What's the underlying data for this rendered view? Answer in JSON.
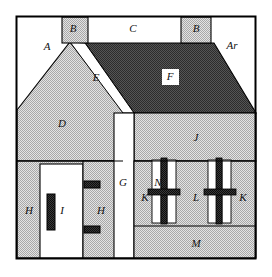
{
  "figure": {
    "kind": "architectural-elevation-diagram",
    "canvas": {
      "width": 272,
      "height": 277
    },
    "frame": {
      "x": 16,
      "y": 16,
      "width": 240,
      "height": 243
    }
  },
  "colors": {
    "background": "#ffffff",
    "outline": "#000000",
    "light_fill": "#ffffff",
    "hatch_fill": "#c9c9c9",
    "dark_fill": "#4a4a4a",
    "very_dark_fill": "#2b2b2b",
    "text": "#111111"
  },
  "labels": [
    {
      "id": "A",
      "text": "A",
      "x": 47,
      "y": 47,
      "zone": "sky-upper-left",
      "boxed": false
    },
    {
      "id": "B1",
      "text": "B",
      "x": 73,
      "y": 29,
      "zone": "chimney-left",
      "boxed": false
    },
    {
      "id": "C",
      "text": "C",
      "x": 133,
      "y": 29,
      "zone": "ridge-top",
      "boxed": false
    },
    {
      "id": "B2",
      "text": "B",
      "x": 196,
      "y": 29,
      "zone": "chimney-right",
      "boxed": false
    },
    {
      "id": "Ar",
      "text": "Ar",
      "x": 232,
      "y": 46,
      "zone": "sky-upper-right",
      "boxed": false
    },
    {
      "id": "E",
      "text": "E",
      "x": 96,
      "y": 78,
      "zone": "verge-board",
      "boxed": false
    },
    {
      "id": "F",
      "text": "F",
      "x": 170,
      "y": 77,
      "zone": "main-roof-slope",
      "boxed": true
    },
    {
      "id": "D",
      "text": "D",
      "x": 62,
      "y": 124,
      "zone": "gable-wall",
      "boxed": false
    },
    {
      "id": "J",
      "text": "J",
      "x": 196,
      "y": 138,
      "zone": "upper-wall-right",
      "boxed": false
    },
    {
      "id": "G",
      "text": "G",
      "x": 123,
      "y": 183,
      "zone": "central-pier",
      "boxed": false
    },
    {
      "id": "H1",
      "text": "H",
      "x": 29,
      "y": 211,
      "zone": "wall-left",
      "boxed": false
    },
    {
      "id": "I1",
      "text": "I",
      "x": 62,
      "y": 211,
      "zone": "door-recess",
      "boxed": false
    },
    {
      "id": "H2",
      "text": "H",
      "x": 101,
      "y": 211,
      "zone": "wall-right-of-door",
      "boxed": false
    },
    {
      "id": "K1",
      "text": "K",
      "x": 145,
      "y": 198,
      "zone": "window-jamb-left",
      "boxed": false
    },
    {
      "id": "N",
      "text": "N",
      "x": 158,
      "y": 183,
      "zone": "window-head",
      "boxed": false
    },
    {
      "id": "L",
      "text": "L",
      "x": 196,
      "y": 198,
      "zone": "window-pier-mid",
      "boxed": false
    },
    {
      "id": "K2",
      "text": "K",
      "x": 243,
      "y": 198,
      "zone": "window-jamb-right",
      "boxed": false
    },
    {
      "id": "M",
      "text": "M",
      "x": 196,
      "y": 244,
      "zone": "plinth-base",
      "boxed": false
    }
  ],
  "zones": {
    "sky_left": {
      "label": "A",
      "fill": "light_fill"
    },
    "sky_right": {
      "label": "Ar",
      "fill": "light_fill"
    },
    "chimney_left": {
      "label": "B",
      "fill": "hatch_fill"
    },
    "chimney_right": {
      "label": "B",
      "fill": "hatch_fill"
    },
    "ridge_band": {
      "label": "C",
      "fill": "light_fill"
    },
    "main_roof": {
      "label": "F",
      "fill": "dark_fill"
    },
    "verge": {
      "label": "E",
      "fill": "light_fill"
    },
    "gable_wall": {
      "label": "D",
      "fill": "hatch_fill"
    },
    "central_pier": {
      "label": "G",
      "fill": "light_fill"
    },
    "upper_right_wall": {
      "label": "J",
      "fill": "hatch_fill"
    },
    "left_wall": {
      "label": "H",
      "fill": "hatch_fill"
    },
    "door_recess": {
      "label": "I",
      "fill": "light_fill"
    },
    "right_wall": {
      "label": "H",
      "fill": "hatch_fill"
    },
    "window_band": {
      "label": "K L N",
      "fill": "hatch_fill"
    },
    "plinth": {
      "label": "M",
      "fill": "hatch_fill"
    }
  },
  "window_panes": {
    "count": 4,
    "left_group": [
      {
        "x": 152,
        "y": 160,
        "width": 9,
        "height": 62
      },
      {
        "x": 167,
        "y": 160,
        "width": 9,
        "height": 62
      }
    ],
    "right_group": [
      {
        "x": 208,
        "y": 160,
        "width": 9,
        "height": 62
      },
      {
        "x": 222,
        "y": 160,
        "width": 9,
        "height": 62
      }
    ],
    "mullions": [
      {
        "x": 161,
        "y": 158,
        "width": 6,
        "height": 66
      },
      {
        "x": 216,
        "y": 158,
        "width": 6,
        "height": 66
      }
    ],
    "transoms": [
      {
        "x": 148,
        "y": 190,
        "width": 32,
        "height": 5
      },
      {
        "x": 204,
        "y": 190,
        "width": 32,
        "height": 5
      }
    ]
  },
  "door_hardware": [
    {
      "name": "door-leaf",
      "x": 47,
      "y": 194,
      "width": 8,
      "height": 36
    },
    {
      "name": "upper-hinge",
      "x": 84,
      "y": 181,
      "width": 16,
      "height": 7
    },
    {
      "name": "lower-hinge",
      "x": 84,
      "y": 226,
      "width": 16,
      "height": 7
    }
  ]
}
